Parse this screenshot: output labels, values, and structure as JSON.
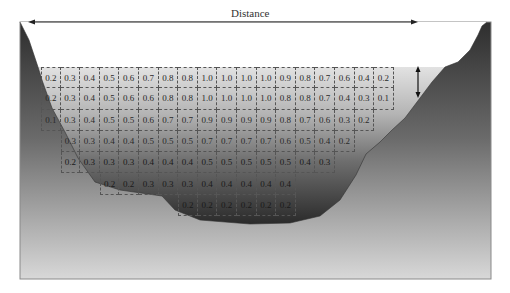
{
  "title": "Distance",
  "grid": {
    "left": 41,
    "top": 67,
    "cell_width": 19.6,
    "cell_height": 21.3,
    "rows": [
      {
        "start_col": 0,
        "values": [
          "0.2",
          "0.3",
          "0.4",
          "0.5",
          "0.6",
          "0.7",
          "0.8",
          "0.8",
          "1.0",
          "1.0",
          "1.0",
          "1.0",
          "0.9",
          "0.8",
          "0.7",
          "0.6",
          "0.4",
          "0.2"
        ]
      },
      {
        "start_col": 0,
        "values": [
          "0.2",
          "0.3",
          "0.4",
          "0.5",
          "0.6",
          "0.6",
          "0.8",
          "0.8",
          "1.0",
          "1.0",
          "1.0",
          "1.0",
          "0.8",
          "0.8",
          "0.7",
          "0.4",
          "0.3",
          "0.1"
        ]
      },
      {
        "start_col": 0,
        "values": [
          "0.1",
          "0.3",
          "0.4",
          "0.5",
          "0.5",
          "0.6",
          "0.7",
          "0.7",
          "0.9",
          "0.9",
          "0.9",
          "0.9",
          "0.8",
          "0.7",
          "0.6",
          "0.3",
          "0.2"
        ]
      },
      {
        "start_col": 1,
        "values": [
          "0.3",
          "0.3",
          "0.4",
          "0.4",
          "0.5",
          "0.5",
          "0.5",
          "0.7",
          "0.7",
          "0.7",
          "0.7",
          "0.6",
          "0.5",
          "0.4",
          "0.2"
        ]
      },
      {
        "start_col": 1,
        "values": [
          "0.2",
          "0.3",
          "0.3",
          "0.3",
          "0.4",
          "0.4",
          "0.4",
          "0.5",
          "0.5",
          "0.5",
          "0.5",
          "0.5",
          "0.4",
          "0.3"
        ]
      },
      {
        "start_col": 3,
        "values": [
          "0.2",
          "0.2",
          "0.3",
          "0.3",
          "0.3",
          "0.4",
          "0.4",
          "0.4",
          "0.4",
          "0.4"
        ]
      },
      {
        "start_col": 7,
        "values": [
          "0.2",
          "0.2",
          "0.2",
          "0.2",
          "0.2",
          "0.2"
        ]
      }
    ]
  },
  "colors": {
    "water_top": "#dcdcdc",
    "water_bottom": "#3a3a3a",
    "bank_dark": "#3c3c3c",
    "bank_light": "#c8c8c8",
    "frame": "#888888"
  }
}
